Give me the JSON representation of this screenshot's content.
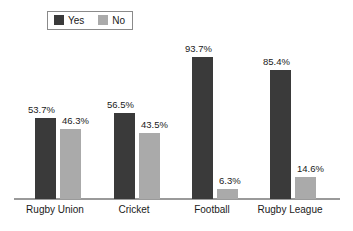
{
  "chart_data": {
    "type": "bar",
    "title": "",
    "subtitle": "",
    "xlabel": "",
    "ylabel": "",
    "ylim": [
      0,
      100
    ],
    "grid": false,
    "legend_position": "top-left",
    "categories": [
      "Rugby Union",
      "Cricket",
      "Football",
      "Rugby League"
    ],
    "series": [
      {
        "name": "Yes",
        "color": "#3a3a3a",
        "values": [
          53.7,
          56.5,
          93.7,
          85.4
        ],
        "labels": [
          "53.7%",
          "56.5%",
          "93.7%",
          "85.4%"
        ]
      },
      {
        "name": "No",
        "color": "#aaaaaa",
        "values": [
          46.3,
          43.5,
          6.3,
          14.6
        ],
        "labels": [
          "46.3%",
          "43.5%",
          "6.3%",
          "14.6%"
        ]
      }
    ]
  },
  "legend": {
    "entries": [
      {
        "label": "Yes",
        "swatch": "#3a3a3a",
        "icon": "legend-swatch-yes"
      },
      {
        "label": "No",
        "swatch": "#aaaaaa",
        "icon": "legend-swatch-no"
      }
    ]
  },
  "axis": {
    "baseline_color": "#9a9a9a"
  },
  "colors": {
    "background": "#ffffff",
    "text": "#1a1a1a",
    "series_yes": "#3a3a3a",
    "series_no": "#aaaaaa",
    "axis": "#9a9a9a",
    "legend_border": "#8a8a8a"
  }
}
